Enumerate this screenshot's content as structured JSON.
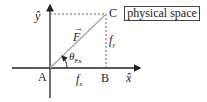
{
  "diagram": {
    "title_box": "physical space",
    "points": {
      "A": {
        "label": "A",
        "x": 50,
        "y": 68
      },
      "B": {
        "label": "B",
        "x": 106,
        "y": 68
      },
      "C": {
        "label": "C",
        "x": 106,
        "y": 14
      }
    },
    "axes": {
      "x_label": "x̂",
      "y_label": "ŷ"
    },
    "vector": {
      "label": "F",
      "arrow": "→"
    },
    "components": {
      "fx": {
        "base": "f",
        "sub": "x"
      },
      "fy": {
        "base": "f",
        "sub": "y"
      }
    },
    "angle": {
      "base": "θ",
      "sub": "Fx"
    },
    "colors": {
      "axis": "#222222",
      "vector": "#aaaaaa",
      "dashed": "#666666"
    }
  }
}
